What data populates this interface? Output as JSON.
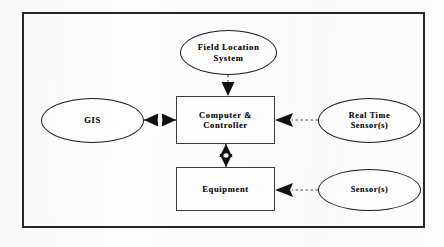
{
  "diagram": {
    "background_color": "#fdfdfd",
    "border_color": "#27272b",
    "line_color": "#1b1b1f",
    "text_color": "#101014",
    "nodes": [
      {
        "id": "field-location-system",
        "label": "Field Location\nSystem",
        "shape": "ellipse",
        "x": 180,
        "y": 30,
        "width": 97,
        "height": 45
      },
      {
        "id": "gis",
        "label": "GIS",
        "shape": "ellipse",
        "x": 41,
        "y": 98,
        "width": 103,
        "height": 45
      },
      {
        "id": "computer-controller",
        "label": "Computer &\nController",
        "shape": "rectangle",
        "x": 176,
        "y": 96,
        "width": 99,
        "height": 48
      },
      {
        "id": "real-time-sensors",
        "label": "Real Time\nSensor(s)",
        "shape": "ellipse",
        "x": 318,
        "y": 98,
        "width": 103,
        "height": 45
      },
      {
        "id": "equipment",
        "label": "Equipment",
        "shape": "rectangle",
        "x": 176,
        "y": 167,
        "width": 99,
        "height": 44
      },
      {
        "id": "sensors",
        "label": "Sensor(s)",
        "shape": "ellipse",
        "x": 318,
        "y": 169,
        "width": 103,
        "height": 42
      }
    ],
    "connectors": [
      {
        "id": "fls-to-computer",
        "from": "field-location-system",
        "to": "computer-controller",
        "style": "dashed",
        "arrows": "single-down"
      },
      {
        "id": "gis-to-computer",
        "from": "gis",
        "to": "computer-controller",
        "style": "solid",
        "arrows": "double-horizontal"
      },
      {
        "id": "realtime-sensors-to-computer",
        "from": "real-time-sensors",
        "to": "computer-controller",
        "style": "dashed",
        "arrows": "single-left"
      },
      {
        "id": "computer-to-equipment",
        "from": "computer-controller",
        "to": "equipment",
        "style": "solid",
        "arrows": "double-vertical"
      },
      {
        "id": "sensors-to-equipment",
        "from": "sensors",
        "to": "equipment",
        "style": "dashed",
        "arrows": "single-left"
      }
    ]
  },
  "frame": {
    "x": 22,
    "y": 12,
    "width": 403,
    "height": 216
  }
}
